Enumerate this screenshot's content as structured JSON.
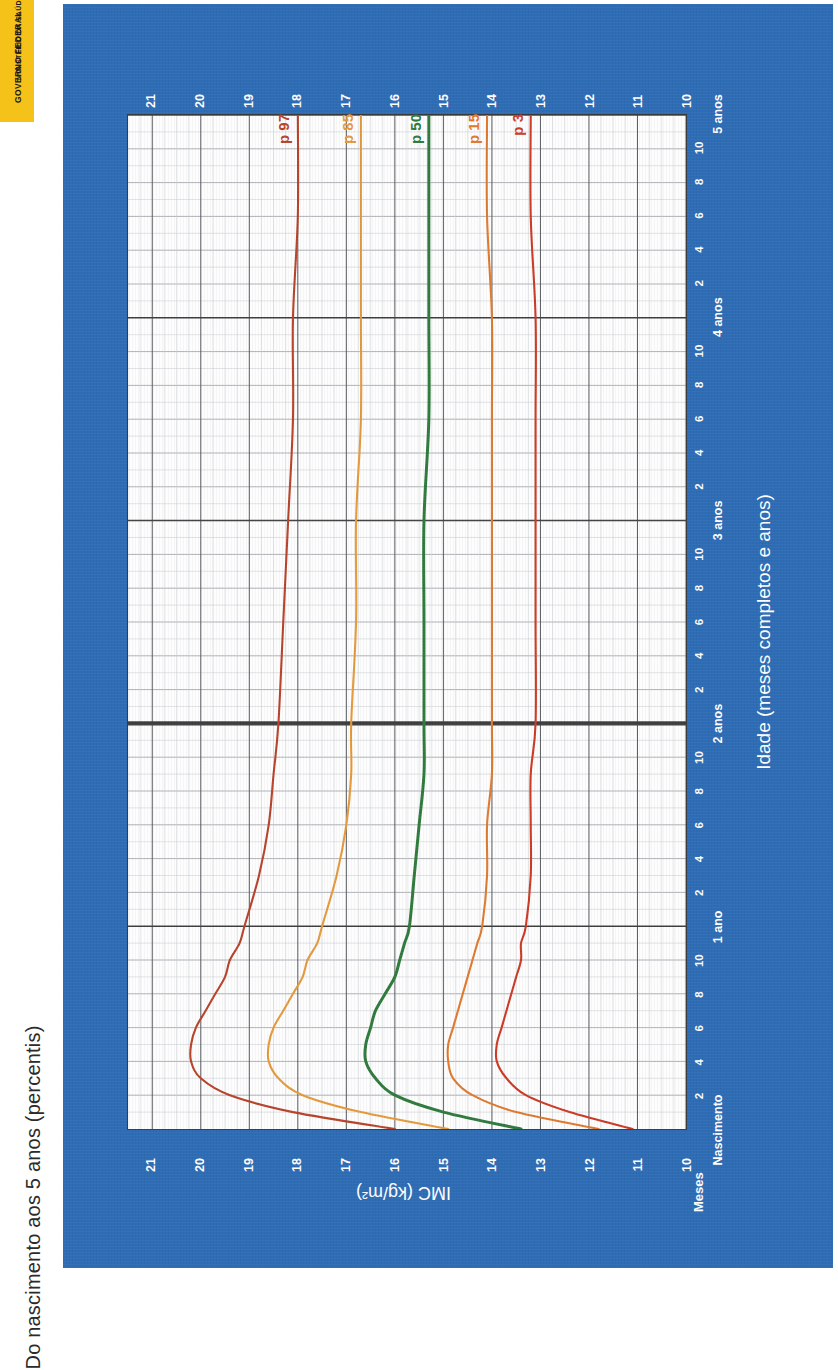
{
  "logo": {
    "line1": "MINISTÉRIO DA SAÚDE",
    "line2": "GOVERNO FEDERAL",
    "bg": "#f5c21a"
  },
  "title": "Do nascimento aos 5 anos (percentis)",
  "card": {
    "bg": "#2e6cb5"
  },
  "labels": {
    "meses": "Meses",
    "nascimento": "Nascimento"
  },
  "chart_data": {
    "type": "line",
    "title": "Do nascimento aos 5 anos (percentis)",
    "xlabel": "Idade (meses completos e anos)",
    "ylabel": "IMC (kg/m²)",
    "ylim": [
      10,
      21.5
    ],
    "xlim": [
      0,
      60
    ],
    "grid": true,
    "legend": "inline-right",
    "y_ticks": [
      10,
      11,
      12,
      13,
      14,
      15,
      16,
      17,
      18,
      19,
      20,
      21
    ],
    "y_tick_labels": [
      "10",
      "11",
      "12",
      "13",
      "14",
      "15",
      "16",
      "17",
      "18",
      "19",
      "20",
      "21"
    ],
    "x_ticks": [
      0,
      2,
      4,
      6,
      8,
      10,
      12,
      14,
      16,
      18,
      20,
      22,
      24,
      26,
      28,
      30,
      32,
      34,
      36,
      38,
      40,
      42,
      44,
      46,
      48,
      50,
      52,
      54,
      56,
      58,
      60
    ],
    "x_tick_labels": [
      "Nascimento",
      "2",
      "4",
      "6",
      "8",
      "10",
      "1 ano",
      "2",
      "4",
      "6",
      "8",
      "10",
      "2 anos",
      "2",
      "4",
      "6",
      "8",
      "10",
      "3 anos",
      "2",
      "4",
      "6",
      "8",
      "10",
      "4 anos",
      "2",
      "4",
      "6",
      "8",
      "10",
      "5 anos"
    ],
    "year_marks": [
      12,
      24,
      36,
      48,
      60
    ],
    "emphasis_line": {
      "x": 24,
      "label": "2 anos",
      "color": "#3f3f3f"
    },
    "series": [
      {
        "name": "p 97",
        "label": "p 97",
        "color": "#b8432a",
        "end_value": 18.0,
        "birth_value": 16.0,
        "x": [
          0,
          1,
          2,
          3,
          4,
          5,
          6,
          7,
          8,
          9,
          10,
          11,
          12,
          15,
          18,
          21,
          24,
          30,
          36,
          42,
          48,
          54,
          60
        ],
        "y": [
          16.0,
          18.1,
          19.4,
          20.0,
          20.2,
          20.2,
          20.1,
          19.9,
          19.7,
          19.5,
          19.4,
          19.2,
          19.1,
          18.8,
          18.6,
          18.5,
          18.4,
          18.3,
          18.2,
          18.1,
          18.1,
          18.0,
          18.0
        ]
      },
      {
        "name": "p 85",
        "label": "p 85",
        "color": "#e59a3c",
        "end_value": 16.7,
        "birth_value": 14.9,
        "x": [
          0,
          1,
          2,
          3,
          4,
          5,
          6,
          7,
          8,
          9,
          10,
          11,
          12,
          15,
          18,
          21,
          24,
          30,
          36,
          42,
          48,
          54,
          60
        ],
        "y": [
          14.9,
          16.7,
          17.9,
          18.4,
          18.6,
          18.6,
          18.5,
          18.3,
          18.1,
          17.9,
          17.8,
          17.6,
          17.5,
          17.2,
          17.0,
          16.9,
          16.9,
          16.8,
          16.8,
          16.7,
          16.7,
          16.7,
          16.7
        ]
      },
      {
        "name": "p 50",
        "label": "p 50",
        "color": "#2f7a3d",
        "end_value": 15.3,
        "birth_value": 13.4,
        "x": [
          0,
          1,
          2,
          3,
          4,
          5,
          6,
          7,
          8,
          9,
          10,
          11,
          12,
          15,
          18,
          21,
          24,
          30,
          36,
          42,
          48,
          54,
          60
        ],
        "y": [
          13.4,
          15.0,
          16.0,
          16.4,
          16.6,
          16.6,
          16.5,
          16.4,
          16.2,
          16.0,
          15.9,
          15.8,
          15.7,
          15.6,
          15.5,
          15.4,
          15.4,
          15.4,
          15.4,
          15.3,
          15.3,
          15.3,
          15.3
        ]
      },
      {
        "name": "p 15",
        "label": "p 15",
        "color": "#e07a2f",
        "end_value": 14.1,
        "birth_value": 11.8,
        "x": [
          0,
          1,
          2,
          3,
          4,
          5,
          6,
          7,
          8,
          9,
          10,
          11,
          12,
          15,
          18,
          21,
          24,
          30,
          36,
          42,
          48,
          54,
          60
        ],
        "y": [
          11.8,
          13.5,
          14.4,
          14.8,
          14.9,
          14.9,
          14.8,
          14.7,
          14.6,
          14.5,
          14.4,
          14.3,
          14.2,
          14.1,
          14.1,
          14.0,
          14.0,
          14.0,
          14.0,
          14.0,
          14.0,
          14.1,
          14.1
        ]
      },
      {
        "name": "p 3",
        "label": "p 3",
        "color": "#cc3a26",
        "end_value": 13.2,
        "birth_value": 11.1,
        "x": [
          0,
          1,
          2,
          3,
          4,
          5,
          6,
          7,
          8,
          9,
          10,
          11,
          12,
          15,
          18,
          21,
          24,
          30,
          36,
          42,
          48,
          54,
          60
        ],
        "y": [
          11.1,
          12.4,
          13.3,
          13.7,
          13.9,
          13.9,
          13.8,
          13.7,
          13.6,
          13.5,
          13.4,
          13.4,
          13.3,
          13.2,
          13.2,
          13.2,
          13.1,
          13.1,
          13.1,
          13.1,
          13.1,
          13.2,
          13.2
        ]
      }
    ]
  }
}
